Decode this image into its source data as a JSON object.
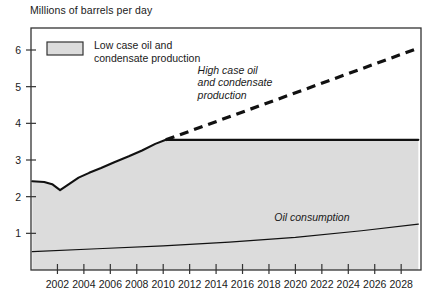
{
  "chart_data": {
    "type": "area",
    "title": "",
    "ylabel": "Millions of barrels per day",
    "xlabel": "",
    "ylim": [
      0,
      6.6
    ],
    "xlim": [
      2000,
      2029.5
    ],
    "grid": false,
    "legend_position": "top-left-inside",
    "y_ticks": [
      1,
      2,
      3,
      4,
      5,
      6
    ],
    "y_tick_labels": [
      "1",
      "2",
      "3",
      "4",
      "5",
      "6"
    ],
    "x_ticks": [
      2002,
      2004,
      2006,
      2008,
      2010,
      2012,
      2014,
      2016,
      2018,
      2020,
      2022,
      2024,
      2026,
      2028
    ],
    "x_tick_labels": [
      "2002",
      "2004",
      "2006",
      "2008",
      "2010",
      "2012",
      "2014",
      "2016",
      "2018",
      "2020",
      "2022",
      "2024",
      "2026",
      "2028"
    ],
    "legend": [
      {
        "label_line1": "Low case oil and",
        "label_line2": "condensate production",
        "swatch_fill": "#dcdcdc",
        "swatch_stroke": "#333333"
      }
    ],
    "annotations": [
      {
        "name": "high-case-label",
        "lines": [
          "High case oil",
          "and condensate",
          "production"
        ],
        "x": 2012.6,
        "y": 5.35,
        "style": "italic"
      },
      {
        "name": "oil-consumption-label",
        "lines": [
          "Oil consumption"
        ],
        "x": 2018.4,
        "y": 1.35,
        "style": "italic"
      }
    ],
    "series": [
      {
        "name": "Low case oil and condensate production",
        "render": "area",
        "fill": "#dcdcdc",
        "stroke": "#111111",
        "x": [
          2000.1,
          2001.0,
          2001.6,
          2002.2,
          2002.9,
          2003.6,
          2004.4,
          2005.3,
          2006.3,
          2007.4,
          2008.4,
          2009.4,
          2010.2,
          2029.3
        ],
        "values": [
          2.42,
          2.4,
          2.34,
          2.18,
          2.35,
          2.52,
          2.65,
          2.78,
          2.94,
          3.1,
          3.26,
          3.44,
          3.55,
          3.55
        ]
      },
      {
        "name": "High case oil and condensate production",
        "render": "dashed-line",
        "stroke": "#111111",
        "x": [
          2010.2,
          2029.3
        ],
        "values": [
          3.55,
          6.05
        ]
      },
      {
        "name": "Oil consumption",
        "render": "line",
        "stroke": "#111111",
        "x": [
          2000.1,
          2005.0,
          2010.0,
          2015.0,
          2020.0,
          2025.0,
          2029.3
        ],
        "values": [
          0.5,
          0.58,
          0.66,
          0.76,
          0.89,
          1.07,
          1.25
        ]
      }
    ],
    "plot_frame": {
      "stroke": "#333333",
      "left": 31,
      "right": 421,
      "top": 28,
      "bottom": 270
    }
  }
}
